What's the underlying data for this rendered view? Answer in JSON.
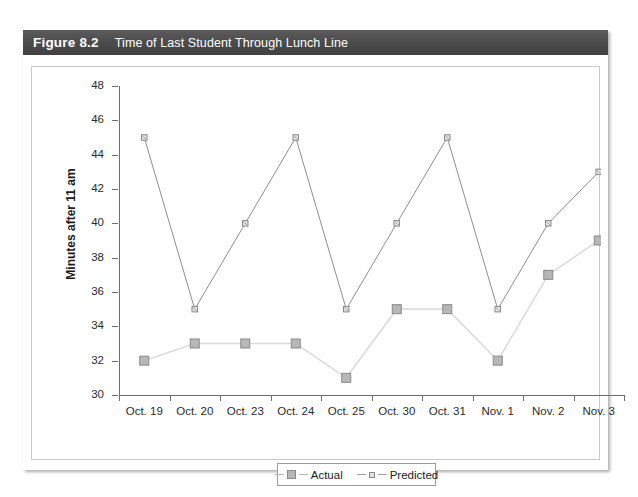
{
  "figure": {
    "number": "Figure 8.2",
    "title": "Time of Last Student Through Lunch Line"
  },
  "legend": {
    "actual_label": "Actual",
    "predicted_label": "Predicted"
  },
  "chart_data": {
    "type": "line",
    "title": "Time of Last Student Through Lunch Line",
    "xlabel": "",
    "ylabel": "Minutes after 11 am",
    "categories": [
      "Oct. 19",
      "Oct. 20",
      "Oct. 23",
      "Oct. 24",
      "Oct. 25",
      "Oct. 30",
      "Oct. 31",
      "Nov. 1",
      "Nov. 2",
      "Nov. 3"
    ],
    "series": [
      {
        "name": "Actual",
        "values": [
          32,
          33,
          33,
          33,
          31,
          35,
          35,
          32,
          37,
          39
        ]
      },
      {
        "name": "Predicted",
        "values": [
          45,
          35,
          40,
          45,
          35,
          40,
          45,
          35,
          40,
          43
        ]
      }
    ],
    "ylim": [
      30,
      48
    ],
    "yticks": [
      30,
      32,
      34,
      36,
      38,
      40,
      42,
      44,
      46,
      48
    ],
    "ytick_labels": [
      "30",
      "32",
      "34",
      "36",
      "38",
      "40",
      "42",
      "44",
      "46",
      "48"
    ],
    "grid": false,
    "legend_position": "bottom-center",
    "colors": {
      "actual_line": "#dcdcdc",
      "actual_marker_fill": "#b7b7b7",
      "actual_marker_edge": "#8a8a8a",
      "predicted_line": "#8f8f8f",
      "predicted_marker_fill": "#e2e2e2",
      "predicted_marker_edge": "#8a8a8a",
      "header_bar": "#4a4a4a",
      "axis": "#6d6d6d"
    }
  }
}
